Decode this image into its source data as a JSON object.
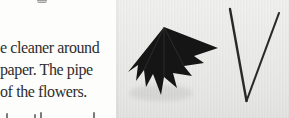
{
  "page": {
    "background_color": "#fdfdfb",
    "text_color": "#2e2e2e",
    "paragraph_lines": [
      "e cleaner around",
      "paper. The pipe",
      "of the flowers."
    ]
  },
  "photo": {
    "background_color": "#e8e8e6",
    "umbrella": {
      "icon": "folded-black-paper-umbrella-icon",
      "color": "#151515",
      "fold_highlight_color": "#4a4a4a"
    },
    "wire": {
      "icon": "v-shaped-wire-icon",
      "color": "#1b1b1b"
    }
  }
}
